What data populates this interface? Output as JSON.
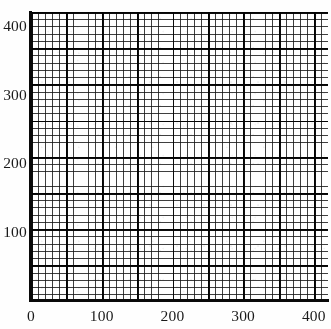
{
  "figure": {
    "kind": "graph-paper-grid",
    "background_color": "#ffffff",
    "ink_color": "#0a0a0a"
  },
  "chart_data": {
    "type": "scatter",
    "title": "",
    "subtitle": "",
    "xlabel": "",
    "ylabel": "",
    "xlim": [
      0,
      420
    ],
    "ylim": [
      0,
      420
    ],
    "grid": true,
    "grid_minor_step": 10,
    "grid_major_step": 50,
    "legend": null,
    "legend_position": "none",
    "annotations": [],
    "series": [],
    "x_ticks": [
      {
        "value": 0,
        "label": "0"
      },
      {
        "value": 100,
        "label": "100"
      },
      {
        "value": 200,
        "label": "200"
      },
      {
        "value": 300,
        "label": "300"
      },
      {
        "value": 400,
        "label": "400"
      }
    ],
    "y_ticks": [
      {
        "value": 100,
        "label": "100"
      },
      {
        "value": 200,
        "label": "200"
      },
      {
        "value": 300,
        "label": "300"
      },
      {
        "value": 400,
        "label": "400"
      }
    ]
  },
  "axes": {
    "x_axis_name": "x-axis",
    "y_axis_name": "y-axis"
  }
}
